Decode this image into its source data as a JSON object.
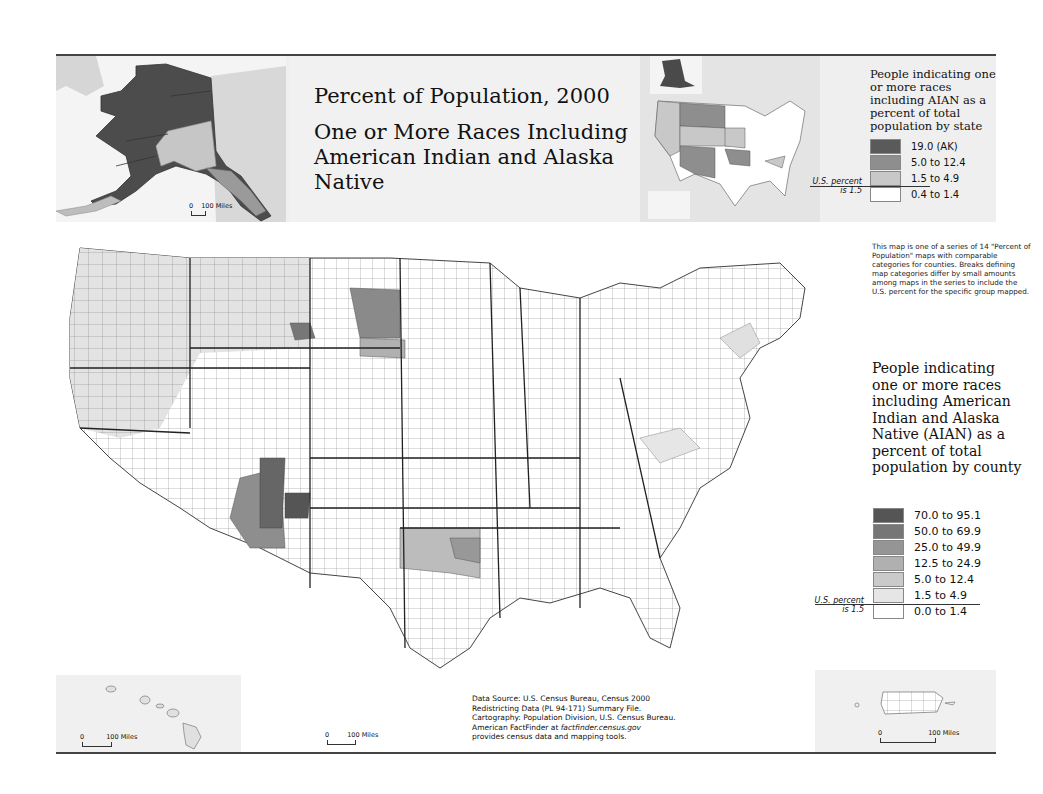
{
  "title": {
    "line1": "Percent of Population, 2000",
    "line2": "One or More Races Including American Indian and Alaska Native"
  },
  "state_legend": {
    "title": "People indicating one or more races including AIAN as a percent of total population by state",
    "us_note_line1": "U.S. percent",
    "us_note_line2": "is 1.5",
    "classes": [
      {
        "label": "19.0 (AK)",
        "color": "#5a5a5a"
      },
      {
        "label": "5.0 to 12.4",
        "color": "#8e8e8e"
      },
      {
        "label": "1.5 to 4.9",
        "color": "#c8c8c8"
      },
      {
        "label": "0.4 to 1.4",
        "color": "#ffffff"
      }
    ]
  },
  "county_legend": {
    "title": "People indicating one or more races including American Indian and Alaska Native (AIAN) as a percent of total population by county",
    "us_note_line1": "U.S. percent",
    "us_note_line2": "is 1.5",
    "classes": [
      {
        "label": "70.0 to 95.1",
        "color": "#555555"
      },
      {
        "label": "50.0 to 69.9",
        "color": "#767676"
      },
      {
        "label": "25.0 to 49.9",
        "color": "#959595"
      },
      {
        "label": "12.5 to 24.9",
        "color": "#b0b0b0"
      },
      {
        "label": "5.0 to 12.4",
        "color": "#cacaca"
      },
      {
        "label": "1.5 to 4.9",
        "color": "#e6e6e6"
      },
      {
        "label": "0.0 to 1.4",
        "color": "#ffffff"
      }
    ]
  },
  "series_note": "This map is one of a series of 14 \"Percent of Population\" maps with comparable categories for counties. Breaks defining map categories differ by small amounts among maps in the series to include the U.S. percent for the specific group mapped.",
  "source": {
    "line1": "Data Source: U.S. Census Bureau, Census 2000",
    "line2": "Redistricting Data (PL 94-171) Summary File.",
    "line3": "Cartography: Population Division, U.S. Census Bureau.",
    "line4_prefix": "American FactFinder at ",
    "line4_link": "factfinder.census.gov",
    "line5": "provides census data and mapping tools."
  },
  "scales": {
    "alaska": {
      "zero": "0",
      "label": "100 Miles"
    },
    "hawaii": {
      "zero": "0",
      "label": "100 Miles"
    },
    "main": {
      "zero": "0",
      "label": "100 Miles"
    },
    "puerto_rico": {
      "zero": "0",
      "label": "100 Miles"
    }
  },
  "insets": {
    "alaska": "Alaska",
    "hawaii": "Hawaii",
    "puerto_rico": "Puerto Rico",
    "state_overview": "United States by state"
  }
}
